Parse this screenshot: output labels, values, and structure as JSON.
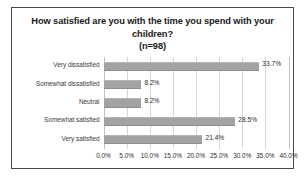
{
  "chart_data": {
    "type": "bar",
    "orientation": "horizontal",
    "title": "How satisfied are you with the time you spend with your children?",
    "title_line1": "How satisfied are you with the time you spend",
    "title_line2": "with your children?",
    "subtitle": "(n=98)",
    "xlabel": "",
    "ylabel": "",
    "categories": [
      "Very dissatisfied",
      "Somewhat dissatisfied",
      "Neutral",
      "Somewhat satisfied",
      "Very satisfied"
    ],
    "values": [
      33.7,
      8.2,
      8.2,
      28.5,
      21.4
    ],
    "value_labels": [
      "33.7%",
      "8.2%",
      "8.2%",
      "28.5%",
      "21.4%"
    ],
    "xlim": [
      0,
      40
    ],
    "xticks": [
      0,
      5,
      10,
      15,
      20,
      25,
      30,
      35,
      40
    ],
    "xtick_labels": [
      "0.0%",
      "5.0%",
      "10.0%",
      "15.0%",
      "20.0%",
      "25.0%",
      "30.0%",
      "35.0%",
      "40.0%"
    ],
    "grid": true,
    "grid_axis": "x",
    "legend": false,
    "bar_color": "#a3a3a3",
    "gridline_color": "#d6d6d6",
    "border_color": "#4a4a4a",
    "text_color": "#2b2b2b",
    "background": "#ffffff"
  }
}
